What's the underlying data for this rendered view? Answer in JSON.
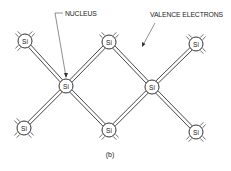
{
  "diagram": {
    "caption": "(b)",
    "labels": {
      "nucleus": "NUCLEUS",
      "valence_electrons": "VALENCE ELECTRONS"
    },
    "atoms": [
      {
        "id": "top-left",
        "symbol": "Si",
        "x": 25,
        "y": 41
      },
      {
        "id": "top-center",
        "symbol": "Si",
        "x": 109,
        "y": 42
      },
      {
        "id": "top-right",
        "symbol": "Si",
        "x": 196,
        "y": 44
      },
      {
        "id": "mid-left",
        "symbol": "Si",
        "x": 66,
        "y": 86
      },
      {
        "id": "mid-right",
        "symbol": "Si",
        "x": 152,
        "y": 87
      },
      {
        "id": "bottom-left",
        "symbol": "Si",
        "x": 24,
        "y": 128
      },
      {
        "id": "bottom-center",
        "symbol": "Si",
        "x": 109,
        "y": 130
      },
      {
        "id": "bottom-right",
        "symbol": "Si",
        "x": 196,
        "y": 132
      }
    ],
    "bonds": [
      [
        "top-left",
        "mid-left"
      ],
      [
        "bottom-left",
        "mid-left"
      ],
      [
        "top-center",
        "mid-left"
      ],
      [
        "bottom-center",
        "mid-left"
      ],
      [
        "top-center",
        "mid-right"
      ],
      [
        "bottom-center",
        "mid-right"
      ],
      [
        "top-right",
        "mid-right"
      ],
      [
        "bottom-right",
        "mid-right"
      ]
    ]
  }
}
